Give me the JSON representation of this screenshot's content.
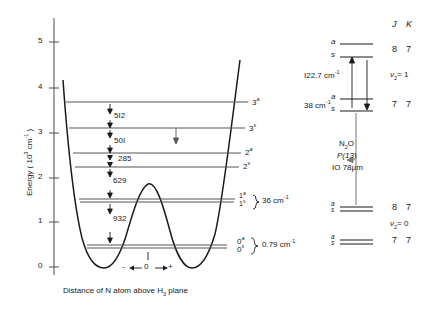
{
  "figure": {
    "type": "energy-level-potential-diagram",
    "axis": {
      "y_title": "Energy ( 10",
      "y_title_sup": "3",
      "y_title_tail": " cm",
      "y_title_sup2": "-1",
      "y_title_end": " )",
      "y_title_full": "Energy ( 10³ cm⁻¹ )",
      "y_ticks": [
        "5",
        "4",
        "3",
        "2",
        "1",
        "0"
      ],
      "y_tick_values": [
        5,
        4,
        3,
        2,
        1,
        0
      ],
      "x_caption": "Distance of N atom above H",
      "x_caption_sub": "3",
      "x_caption_tail": " plane",
      "x_caption_full": "Distance of N atom above H3 plane",
      "x_origin_label": "0",
      "x_minus": "-",
      "x_plus": "+"
    },
    "potential": {
      "name": "double-minimum inversion potential",
      "barrier_height_cm": 2050,
      "well_minimum_cm": 0
    },
    "levels": [
      {
        "label": "3",
        "sup": "a",
        "energy_cm": 3620
      },
      {
        "label": "3",
        "sup": "s",
        "energy_cm": 3108
      },
      {
        "label": "2",
        "sup": "a",
        "energy_cm": 2607
      },
      {
        "label": "2",
        "sup": "s",
        "energy_cm": 2322
      },
      {
        "label": "1",
        "sup": "a",
        "energy_cm": 1693
      },
      {
        "label": "1",
        "sup": "s",
        "energy_cm": 1657
      },
      {
        "label": "0",
        "sup": "a",
        "energy_cm": 725
      },
      {
        "label": "0",
        "sup": "s",
        "energy_cm": 724
      }
    ],
    "gap_labels": [
      {
        "value": "5I2",
        "text": "512"
      },
      {
        "value": "50I",
        "text": "501"
      },
      {
        "value": "285",
        "text": "285"
      },
      {
        "value": "629",
        "text": "629"
      },
      {
        "value": "932",
        "text": "932"
      }
    ],
    "splittings": [
      {
        "text": "36 cm",
        "sup": "-1",
        "full": "36 cm-1",
        "pair": "1a/1s"
      },
      {
        "text": "0.79 cm",
        "sup": "-1",
        "full": "0·79 cm-1",
        "pair": "0a/0s"
      }
    ]
  },
  "right_diagram": {
    "column_headers": {
      "j": "J",
      "k": "K"
    },
    "rows": [
      {
        "parity_a": "a",
        "parity_s": "s",
        "j": "8",
        "k": "7",
        "manifold": "v2=1"
      },
      {
        "parity_a": "a",
        "parity_s": "s",
        "j": "7",
        "k": "7",
        "manifold": "v2=1"
      },
      {
        "parity_a": "a",
        "parity_s": "s",
        "j": "8",
        "k": "7",
        "manifold": "v2=0"
      },
      {
        "parity_a": "a",
        "parity_s": "s",
        "j": "7",
        "k": "7",
        "manifold": "v2=0"
      }
    ],
    "manifold_upper": {
      "symbol": "v",
      "sub": "2",
      "eq": "= 1",
      "full": "v2 = 1"
    },
    "manifold_lower": {
      "symbol": "v",
      "sub": "2",
      "eq": "= 0",
      "full": "v2 = 0"
    },
    "interval_upper": {
      "text": "I22.7 cm",
      "sup": "-1",
      "full": "122·7 cm-1"
    },
    "interval_lower": {
      "text": "38 cm",
      "sup": "-1",
      "full": "38 cm-1"
    },
    "laser": {
      "molecule": "N",
      "molecule_sub": "2",
      "molecule_tail": "O",
      "line": "P(13)",
      "wavelength": "IO 78",
      "wavelength_unit": "μm",
      "full": "N2O P(13) 10·78 μm"
    }
  },
  "colors": {
    "ink": "#1a1a1a",
    "level_line": "#555555",
    "axis": "#4a4a4a",
    "background": "#ffffff"
  }
}
